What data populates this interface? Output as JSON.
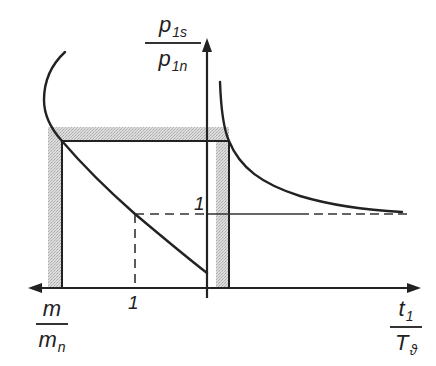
{
  "diagram": {
    "y_axis_label": {
      "numerator": {
        "base": "p",
        "subscript": "1s"
      },
      "denominator": {
        "base": "p",
        "subscript": "1n"
      }
    },
    "x_axis_right_label": {
      "numerator": {
        "base": "t",
        "subscript": "1"
      },
      "denominator": {
        "base": "T",
        "subscript": "ϑ"
      }
    },
    "x_axis_left_label": {
      "numerator": {
        "base": "m",
        "subscript": ""
      },
      "denominator": {
        "base": "m",
        "subscript": "n"
      }
    },
    "tick_labels": {
      "x_left_one": "1",
      "y_one": "1"
    },
    "colors": {
      "line": "#222222",
      "band": "#c9c9c9"
    }
  }
}
